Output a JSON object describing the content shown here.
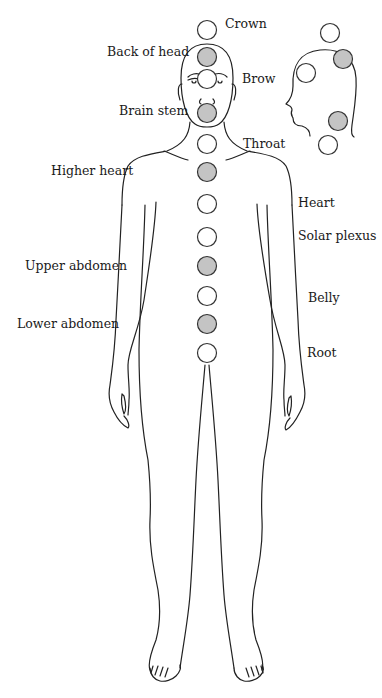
{
  "diagram": {
    "type": "body-energy-points",
    "colors": {
      "outline": "#222222",
      "circle_open_fill": "#ffffff",
      "circle_filled": "#c4c4c4",
      "circle_stroke": "#333333"
    },
    "labels": {
      "crown": "Crown",
      "back_of_head": "Back of head",
      "brow": "Brow",
      "brain_stem": "Brain stem",
      "throat": "Throat",
      "higher_heart": "Higher heart",
      "heart": "Heart",
      "solar_plexus": "Solar plexus",
      "upper_abdomen": "Upper abdomen",
      "belly": "Belly",
      "lower_abdomen": "Lower abdomen",
      "root": "Root"
    },
    "front_points": [
      {
        "name": "Crown",
        "filled": false
      },
      {
        "name": "Back of head",
        "filled": true
      },
      {
        "name": "Brow",
        "filled": false
      },
      {
        "name": "Brain stem",
        "filled": true
      },
      {
        "name": "Throat",
        "filled": false
      },
      {
        "name": "Higher heart",
        "filled": true
      },
      {
        "name": "Heart",
        "filled": false
      },
      {
        "name": "Solar plexus",
        "filled": false
      },
      {
        "name": "Upper abdomen",
        "filled": true
      },
      {
        "name": "Belly",
        "filled": false
      },
      {
        "name": "Lower abdomen",
        "filled": true
      },
      {
        "name": "Root",
        "filled": false
      }
    ],
    "profile_points": [
      {
        "name": "Crown",
        "filled": false
      },
      {
        "name": "Back of head",
        "filled": true
      },
      {
        "name": "Brow",
        "filled": false
      },
      {
        "name": "Brain stem",
        "filled": true
      },
      {
        "name": "Throat",
        "filled": false
      }
    ]
  }
}
